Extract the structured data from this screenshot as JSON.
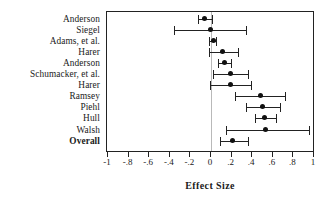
{
  "chart_data": {
    "type": "scatter",
    "title": "",
    "xlabel": "Effect Size",
    "ylabel": "",
    "xlim": [
      -1,
      1
    ],
    "grid": false,
    "legend": "none",
    "zero_reference_line": 0,
    "tick_labels": [
      "-1",
      "-.8",
      "-.6",
      "-.4",
      "-.2",
      "0",
      ".2",
      ".4",
      ".6",
      ".8",
      "1"
    ],
    "tick_values": [
      -1,
      -0.8,
      -0.6,
      -0.4,
      -0.2,
      0,
      0.2,
      0.4,
      0.6,
      0.8,
      1
    ],
    "categories": [
      "Anderson",
      "Siegel",
      "Adams, et al.",
      "Harer",
      "Anderson",
      "Schumacker, et al.",
      "Harer",
      "Ramsey",
      "Piehl",
      "Hull",
      "Walsh",
      "Overall"
    ],
    "points": [
      {
        "label": "Anderson",
        "value": -0.05,
        "ci_low": -0.12,
        "ci_high": 0.02,
        "bold": false
      },
      {
        "label": "Siegel",
        "value": 0.0,
        "ci_low": -0.35,
        "ci_high": 0.35,
        "bold": false
      },
      {
        "label": "Adams, et al.",
        "value": 0.03,
        "ci_low": -0.01,
        "ci_high": 0.06,
        "bold": false
      },
      {
        "label": "Harer",
        "value": 0.12,
        "ci_low": -0.01,
        "ci_high": 0.27,
        "bold": false
      },
      {
        "label": "Anderson",
        "value": 0.14,
        "ci_low": 0.08,
        "ci_high": 0.2,
        "bold": false
      },
      {
        "label": "Schumacker, et al.",
        "value": 0.2,
        "ci_low": 0.03,
        "ci_high": 0.37,
        "bold": false
      },
      {
        "label": "Harer",
        "value": 0.2,
        "ci_low": 0.0,
        "ci_high": 0.4,
        "bold": false
      },
      {
        "label": "Ramsey",
        "value": 0.49,
        "ci_low": 0.24,
        "ci_high": 0.73,
        "bold": false
      },
      {
        "label": "Piehl",
        "value": 0.51,
        "ci_low": 0.35,
        "ci_high": 0.68,
        "bold": false
      },
      {
        "label": "Hull",
        "value": 0.53,
        "ci_low": 0.44,
        "ci_high": 0.64,
        "bold": false
      },
      {
        "label": "Walsh",
        "value": 0.54,
        "ci_low": 0.16,
        "ci_high": 0.96,
        "bold": false
      },
      {
        "label": "Overall",
        "value": 0.22,
        "ci_low": 0.1,
        "ci_high": 0.37,
        "bold": true
      }
    ],
    "colors": {
      "marker": "#111111",
      "line": "#222222",
      "frame": "#222222",
      "zero_line": "#b9b9b9",
      "background": "#ffffff"
    }
  }
}
